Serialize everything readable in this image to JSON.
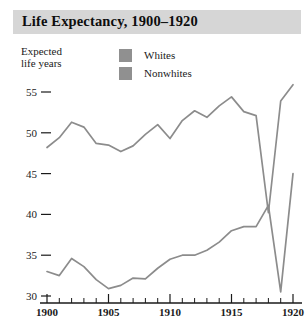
{
  "title": "Life Expectancy, 1900–1920",
  "axis_caption_line1": "Expected",
  "axis_caption_line2": "life years",
  "legend": [
    {
      "label": "Whites",
      "color": "#909090",
      "swatch": "legend-swatch-whites"
    },
    {
      "label": "Nonwhites",
      "color": "#909090",
      "swatch": "legend-swatch-nonwhites"
    }
  ],
  "colors": {
    "title_band": "#d6d6d6",
    "line": "#8c8c8c",
    "axis": "#1a1a1a",
    "text": "#1a1a1a",
    "background": "#ffffff"
  },
  "chart_data": {
    "type": "line",
    "title": "Life Expectancy, 1900–1920",
    "xlabel": "",
    "ylabel": "Expected life years",
    "xlim": [
      1900,
      1920
    ],
    "ylim": [
      29,
      57
    ],
    "grid": false,
    "legend_position": "top-center",
    "y_ticks": [
      30,
      35,
      40,
      45,
      50,
      55
    ],
    "x_ticks": [
      1900,
      1905,
      1910,
      1915,
      1920
    ],
    "x_minor_ticks": [
      1901,
      1902,
      1903,
      1904,
      1906,
      1907,
      1908,
      1909,
      1911,
      1912,
      1913,
      1914,
      1916,
      1917,
      1918,
      1919
    ],
    "x": [
      1900,
      1901,
      1902,
      1903,
      1904,
      1905,
      1906,
      1907,
      1908,
      1909,
      1910,
      1911,
      1912,
      1913,
      1914,
      1915,
      1916,
      1917,
      1918,
      1919,
      1920
    ],
    "series": [
      {
        "name": "Whites",
        "color": "#8c8c8c",
        "values": [
          48.2,
          49.4,
          51.3,
          50.7,
          48.7,
          48.5,
          47.7,
          48.4,
          49.8,
          51.0,
          49.3,
          51.5,
          52.7,
          51.9,
          53.3,
          54.4,
          52.6,
          52.1,
          40.2,
          53.9,
          55.9
        ]
      },
      {
        "name": "Nonwhites",
        "color": "#8c8c8c",
        "values": [
          33.0,
          32.5,
          34.6,
          33.6,
          32.0,
          30.9,
          31.3,
          32.2,
          32.1,
          33.4,
          34.5,
          35.0,
          35.0,
          35.6,
          36.6,
          38.0,
          38.5,
          38.5,
          41.1,
          30.5,
          45.0
        ]
      }
    ]
  }
}
